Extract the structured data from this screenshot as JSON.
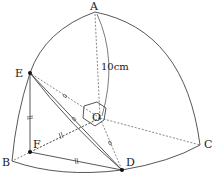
{
  "diagram": {
    "type": "geometry-3d-solid",
    "points": {
      "A": {
        "label": "A",
        "x": 95,
        "y": 12
      },
      "B": {
        "label": "B",
        "x": 12,
        "y": 161
      },
      "C": {
        "label": "C",
        "x": 200,
        "y": 145
      },
      "O": {
        "label": "O",
        "x": 100,
        "y": 118
      },
      "E": {
        "label": "E",
        "x": 30,
        "y": 73
      },
      "F": {
        "label": "F",
        "x": 30,
        "y": 152
      },
      "D": {
        "label": "D",
        "x": 122,
        "y": 170
      }
    },
    "measurement": {
      "label": "10cm"
    },
    "stroke_color": "#333333",
    "point_color": "#111111"
  }
}
